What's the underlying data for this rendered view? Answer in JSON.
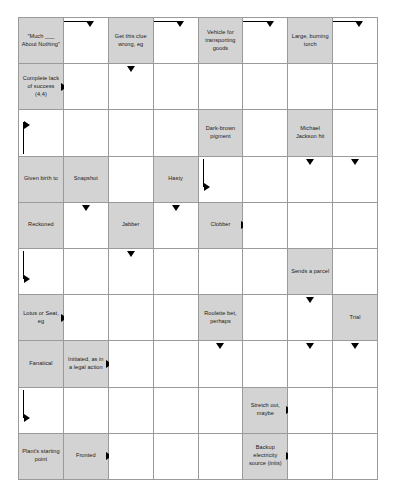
{
  "puzzle": {
    "type": "arrowword-crossword",
    "columns": 8,
    "rows": 10,
    "colors": {
      "clue_cell_background": "#d3d3d3",
      "answer_cell_background": "#ffffff",
      "grid_line": "#9a9a9a",
      "text": "#1a1a1a",
      "arrow": "#000000"
    },
    "cells": [
      {
        "r": 0,
        "c": 0,
        "clue": true,
        "text": "\"Much ___ About Nothing\""
      },
      {
        "r": 0,
        "c": 1,
        "clue": false,
        "text": "",
        "arrows": [
          "ell-down"
        ]
      },
      {
        "r": 0,
        "c": 2,
        "clue": true,
        "text": "Get this clue wrong, eg"
      },
      {
        "r": 0,
        "c": 3,
        "clue": false,
        "text": "",
        "arrows": [
          "ell-down"
        ]
      },
      {
        "r": 0,
        "c": 4,
        "clue": true,
        "text": "Vehicle for transporting goods"
      },
      {
        "r": 0,
        "c": 5,
        "clue": false,
        "text": "",
        "arrows": [
          "ell-down"
        ]
      },
      {
        "r": 0,
        "c": 6,
        "clue": true,
        "text": "Large, burning torch"
      },
      {
        "r": 0,
        "c": 7,
        "clue": false,
        "text": "",
        "arrows": [
          "ell-down"
        ]
      },
      {
        "r": 1,
        "c": 0,
        "clue": true,
        "text": "Complete lack of success (4,4)",
        "arrows": [
          "right-plain"
        ]
      },
      {
        "r": 1,
        "c": 1,
        "clue": false,
        "text": ""
      },
      {
        "r": 1,
        "c": 2,
        "clue": false,
        "text": "",
        "arrows": [
          "down-plain"
        ]
      },
      {
        "r": 1,
        "c": 3,
        "clue": false,
        "text": ""
      },
      {
        "r": 1,
        "c": 4,
        "clue": false,
        "text": ""
      },
      {
        "r": 1,
        "c": 5,
        "clue": false,
        "text": ""
      },
      {
        "r": 1,
        "c": 6,
        "clue": false,
        "text": ""
      },
      {
        "r": 1,
        "c": 7,
        "clue": false,
        "text": ""
      },
      {
        "r": 2,
        "c": 0,
        "clue": false,
        "text": "",
        "arrows": [
          "flag-up"
        ]
      },
      {
        "r": 2,
        "c": 1,
        "clue": false,
        "text": ""
      },
      {
        "r": 2,
        "c": 2,
        "clue": false,
        "text": ""
      },
      {
        "r": 2,
        "c": 3,
        "clue": false,
        "text": ""
      },
      {
        "r": 2,
        "c": 4,
        "clue": true,
        "text": "Dark-brown pigment"
      },
      {
        "r": 2,
        "c": 5,
        "clue": false,
        "text": ""
      },
      {
        "r": 2,
        "c": 6,
        "clue": true,
        "text": "Michael Jackson hit"
      },
      {
        "r": 2,
        "c": 7,
        "clue": false,
        "text": ""
      },
      {
        "r": 3,
        "c": 0,
        "clue": true,
        "text": "Given birth to"
      },
      {
        "r": 3,
        "c": 1,
        "clue": true,
        "text": "Snapshot"
      },
      {
        "r": 3,
        "c": 2,
        "clue": false,
        "text": ""
      },
      {
        "r": 3,
        "c": 3,
        "clue": true,
        "text": "Hasty"
      },
      {
        "r": 3,
        "c": 4,
        "clue": false,
        "text": "",
        "arrows": [
          "ell-right"
        ]
      },
      {
        "r": 3,
        "c": 5,
        "clue": false,
        "text": ""
      },
      {
        "r": 3,
        "c": 6,
        "clue": false,
        "text": "",
        "arrows": [
          "down-plain"
        ]
      },
      {
        "r": 3,
        "c": 7,
        "clue": false,
        "text": "",
        "arrows": [
          "down-plain"
        ]
      },
      {
        "r": 4,
        "c": 0,
        "clue": true,
        "text": "Reckoned"
      },
      {
        "r": 4,
        "c": 1,
        "clue": false,
        "text": "",
        "arrows": [
          "down-plain"
        ]
      },
      {
        "r": 4,
        "c": 2,
        "clue": true,
        "text": "Jabber"
      },
      {
        "r": 4,
        "c": 3,
        "clue": false,
        "text": "",
        "arrows": [
          "down-plain"
        ]
      },
      {
        "r": 4,
        "c": 4,
        "clue": true,
        "text": "Clobber",
        "arrows": [
          "right-plain"
        ]
      },
      {
        "r": 4,
        "c": 5,
        "clue": false,
        "text": ""
      },
      {
        "r": 4,
        "c": 6,
        "clue": false,
        "text": ""
      },
      {
        "r": 4,
        "c": 7,
        "clue": false,
        "text": ""
      },
      {
        "r": 5,
        "c": 0,
        "clue": false,
        "text": "",
        "arrows": [
          "ell-right"
        ]
      },
      {
        "r": 5,
        "c": 1,
        "clue": false,
        "text": ""
      },
      {
        "r": 5,
        "c": 2,
        "clue": false,
        "text": "",
        "arrows": [
          "down-plain"
        ]
      },
      {
        "r": 5,
        "c": 3,
        "clue": false,
        "text": ""
      },
      {
        "r": 5,
        "c": 4,
        "clue": false,
        "text": ""
      },
      {
        "r": 5,
        "c": 5,
        "clue": false,
        "text": ""
      },
      {
        "r": 5,
        "c": 6,
        "clue": true,
        "text": "Sends a parcel"
      },
      {
        "r": 5,
        "c": 7,
        "clue": false,
        "text": ""
      },
      {
        "r": 6,
        "c": 0,
        "clue": true,
        "text": "Lotus or Seat, eg",
        "arrows": [
          "right-plain"
        ]
      },
      {
        "r": 6,
        "c": 1,
        "clue": false,
        "text": ""
      },
      {
        "r": 6,
        "c": 2,
        "clue": false,
        "text": ""
      },
      {
        "r": 6,
        "c": 3,
        "clue": false,
        "text": ""
      },
      {
        "r": 6,
        "c": 4,
        "clue": true,
        "text": "Roulette bet, perhaps"
      },
      {
        "r": 6,
        "c": 5,
        "clue": false,
        "text": ""
      },
      {
        "r": 6,
        "c": 6,
        "clue": false,
        "text": "",
        "arrows": [
          "down-plain"
        ]
      },
      {
        "r": 6,
        "c": 7,
        "clue": true,
        "text": "Trial"
      },
      {
        "r": 7,
        "c": 0,
        "clue": true,
        "text": "Fanatical"
      },
      {
        "r": 7,
        "c": 1,
        "clue": true,
        "text": "Initiated, as in a legal action",
        "arrows": [
          "right-plain"
        ]
      },
      {
        "r": 7,
        "c": 2,
        "clue": false,
        "text": ""
      },
      {
        "r": 7,
        "c": 3,
        "clue": false,
        "text": ""
      },
      {
        "r": 7,
        "c": 4,
        "clue": false,
        "text": "",
        "arrows": [
          "down-plain"
        ]
      },
      {
        "r": 7,
        "c": 5,
        "clue": false,
        "text": ""
      },
      {
        "r": 7,
        "c": 6,
        "clue": false,
        "text": "",
        "arrows": [
          "down-plain"
        ]
      },
      {
        "r": 7,
        "c": 7,
        "clue": false,
        "text": "",
        "arrows": [
          "down-plain"
        ]
      },
      {
        "r": 8,
        "c": 0,
        "clue": false,
        "text": "",
        "arrows": [
          "ell-right"
        ]
      },
      {
        "r": 8,
        "c": 1,
        "clue": false,
        "text": ""
      },
      {
        "r": 8,
        "c": 2,
        "clue": false,
        "text": ""
      },
      {
        "r": 8,
        "c": 3,
        "clue": false,
        "text": ""
      },
      {
        "r": 8,
        "c": 4,
        "clue": false,
        "text": ""
      },
      {
        "r": 8,
        "c": 5,
        "clue": true,
        "text": "Stretch out, maybe",
        "arrows": [
          "right-plain"
        ]
      },
      {
        "r": 8,
        "c": 6,
        "clue": false,
        "text": ""
      },
      {
        "r": 8,
        "c": 7,
        "clue": false,
        "text": ""
      },
      {
        "r": 9,
        "c": 0,
        "clue": true,
        "text": "Plant's starting point"
      },
      {
        "r": 9,
        "c": 1,
        "clue": true,
        "text": "Fronted",
        "arrows": [
          "right-plain"
        ]
      },
      {
        "r": 9,
        "c": 2,
        "clue": false,
        "text": ""
      },
      {
        "r": 9,
        "c": 3,
        "clue": false,
        "text": ""
      },
      {
        "r": 9,
        "c": 4,
        "clue": false,
        "text": ""
      },
      {
        "r": 9,
        "c": 5,
        "clue": true,
        "text": "Backup electricity source (inits)",
        "arrows": [
          "right-plain"
        ]
      },
      {
        "r": 9,
        "c": 6,
        "clue": false,
        "text": ""
      },
      {
        "r": 9,
        "c": 7,
        "clue": false,
        "text": ""
      },
      {
        "r": 10,
        "c": 0,
        "clue": false,
        "text": "",
        "arrows": [
          "ell-right"
        ]
      },
      {
        "r": 10,
        "c": 1,
        "clue": false,
        "text": ""
      },
      {
        "r": 10,
        "c": 2,
        "clue": false,
        "text": ""
      },
      {
        "r": 10,
        "c": 3,
        "clue": false,
        "text": ""
      },
      {
        "r": 10,
        "c": 4,
        "clue": true,
        "text": "Garment worn on the top half of your body",
        "arrows": [
          "right-plain"
        ]
      },
      {
        "r": 10,
        "c": 5,
        "clue": false,
        "text": ""
      },
      {
        "r": 10,
        "c": 6,
        "clue": false,
        "text": ""
      },
      {
        "r": 10,
        "c": 7,
        "clue": false,
        "text": ""
      }
    ]
  }
}
